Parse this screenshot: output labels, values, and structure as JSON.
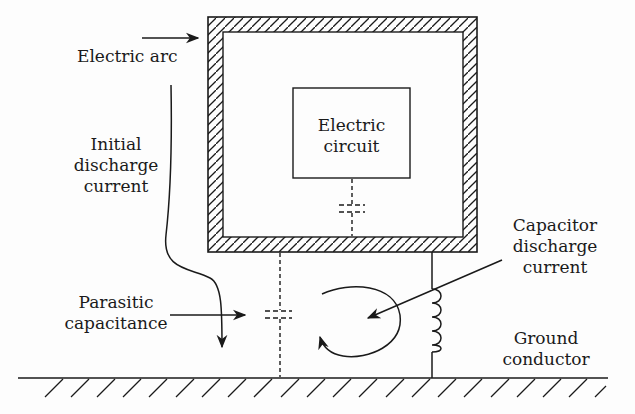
{
  "diagram": {
    "labels": {
      "electric_arc": "Electric arc",
      "initial_discharge": [
        "Initial",
        "discharge",
        "current"
      ],
      "electric_circuit": [
        "Electric",
        "circuit"
      ],
      "capacitor_discharge": [
        "Capacitor",
        "discharge",
        "current"
      ],
      "parasitic_capacitance": [
        "Parasitic",
        "capacitance"
      ],
      "ground_conductor": [
        "Ground",
        "conductor"
      ]
    },
    "colors": {
      "stroke": "#1a1a1a",
      "background": "#fdfdfd"
    },
    "elements": [
      "shielded-enclosure",
      "electric-circuit-box",
      "internal-parasitic-capacitor",
      "external-parasitic-capacitor",
      "ground-conductor-inductor",
      "ground-plane",
      "electric-arc-arrow",
      "initial-discharge-arrow",
      "parasitic-capacitance-arrow",
      "capacitor-discharge-arrow",
      "circulating-current-arrow"
    ]
  }
}
